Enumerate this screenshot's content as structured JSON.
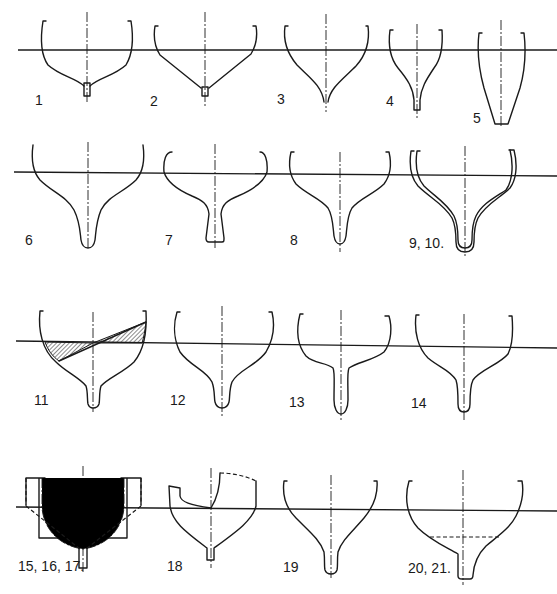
{
  "diagram": {
    "colors": {
      "ink": "#1a1a1a",
      "background": "#ffffff"
    },
    "rows": [
      {
        "row": 1,
        "waterline_y": 50,
        "figures": [
          {
            "id": "fig-1",
            "label": "1",
            "shape": "round bilge, flat flared bottom, small keel stub"
          },
          {
            "id": "fig-2",
            "label": "2",
            "shape": "hard chine V-bottom, small keel stub"
          },
          {
            "id": "fig-3",
            "label": "3",
            "shape": "deep V with concave wine-glass garboard"
          },
          {
            "id": "fig-4",
            "label": "4",
            "shape": "narrow wine-glass with keel fin"
          },
          {
            "id": "fig-5",
            "label": "5",
            "shape": "narrow tapered V with flat bottom"
          }
        ]
      },
      {
        "row": 2,
        "waterline_y": 173,
        "figures": [
          {
            "id": "fig-6",
            "label": "6",
            "shape": "wine-glass with deep rounded fin keel"
          },
          {
            "id": "fig-7",
            "label": "7",
            "shape": "tumblehome topsides with flared fin keel"
          },
          {
            "id": "fig-8",
            "label": "8",
            "shape": "wine-glass with rounded fin keel"
          },
          {
            "id": "fig-9-10",
            "label": "9, 10.",
            "shape": "two overlaid wine-glass sections"
          }
        ]
      },
      {
        "row": 3,
        "waterline_y": 343,
        "figures": [
          {
            "id": "fig-11",
            "label": "11",
            "shape": "heeled section with hatched in/out wedges"
          },
          {
            "id": "fig-12",
            "label": "12",
            "shape": "round bilge with fin keel"
          },
          {
            "id": "fig-13",
            "label": "13",
            "shape": "flat floors with long parallel fin"
          },
          {
            "id": "fig-14",
            "label": "14",
            "shape": "round bilge with parallel fin"
          }
        ]
      },
      {
        "row": 4,
        "waterline_y": 508,
        "figures": [
          {
            "id": "fig-15-17",
            "label": "15, 16, 17.",
            "shape": "box section, round section (dash-dot) and V section (dashed) overlaid"
          },
          {
            "id": "fig-18",
            "label": "18",
            "shape": "heeled V section with dashed deck edge"
          },
          {
            "id": "fig-19",
            "label": "19",
            "shape": "wine-glass with narrow fin"
          },
          {
            "id": "fig-20-21",
            "label": "20, 21.",
            "shape": "wine-glass with dashed ballast line and stepped keel"
          }
        ]
      }
    ]
  }
}
